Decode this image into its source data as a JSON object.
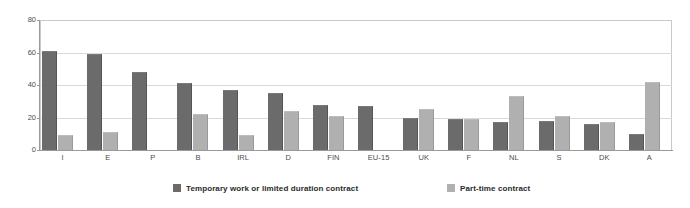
{
  "chart_data": {
    "type": "bar",
    "title": "",
    "subtitle": "",
    "xlabel": "",
    "ylabel": "",
    "ylim": [
      0,
      80
    ],
    "yticks": [
      0,
      20,
      40,
      60,
      80
    ],
    "grid": true,
    "legend_position": "bottom",
    "categories": [
      "I",
      "E",
      "P",
      "B",
      "IRL",
      "D",
      "FIN",
      "EU-15",
      "UK",
      "F",
      "NL",
      "S",
      "DK",
      "A"
    ],
    "series": [
      {
        "name": "Temporary work or limited duration contract",
        "color": "#6b6b6b",
        "values": [
          61,
          59,
          48,
          41,
          37,
          35,
          28,
          27,
          20,
          19,
          17,
          18,
          16,
          10
        ]
      },
      {
        "name": "Part-time contract",
        "color": "#b0b0b0",
        "values": [
          9,
          11,
          null,
          22,
          9,
          24,
          21,
          null,
          25,
          19,
          33,
          21,
          17,
          42
        ]
      }
    ]
  },
  "legend": {
    "items": [
      {
        "label": "Temporary work or limited duration contract",
        "swatch": "dark"
      },
      {
        "label": "Part-time contract",
        "swatch": "light"
      }
    ]
  },
  "colors": {
    "series_dark": "#6b6b6b",
    "series_light": "#b0b0b0",
    "grid": "#d9d9d9",
    "axis": "#9a9a9a",
    "text": "#4d4d4d",
    "background": "#ffffff"
  }
}
